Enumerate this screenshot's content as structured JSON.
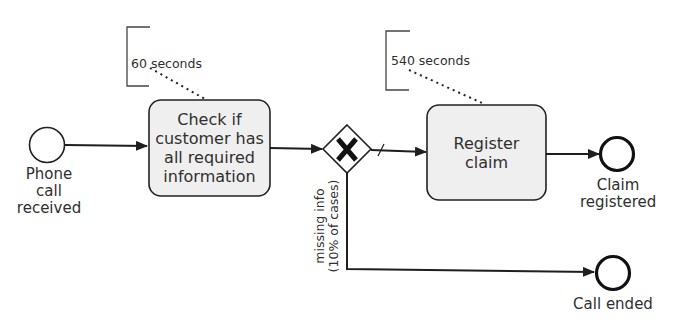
{
  "diagram": {
    "type": "BPMN process",
    "start_event": {
      "label_line1": "Phone call",
      "label_line2": "received"
    },
    "tasks": [
      {
        "id": "check",
        "label": "Check if customer has all required information",
        "duration": "60 seconds"
      },
      {
        "id": "register",
        "label": "Register claim",
        "duration": "540 seconds"
      }
    ],
    "gateway": {
      "type": "exclusive",
      "symbol": "X"
    },
    "conditions": {
      "missing_line1": "missing info",
      "missing_line2": "(10% of cases)"
    },
    "end_events": [
      {
        "id": "claim",
        "label_line1": "Claim",
        "label_line2": "registered"
      },
      {
        "id": "ended",
        "label_line1": "Call ended"
      }
    ],
    "annotations": {
      "check": "60 seconds",
      "register": "540 seconds"
    },
    "colors": {
      "task_fill": "#efefef",
      "stroke": "#222222",
      "text": "#2f2f2f"
    }
  }
}
